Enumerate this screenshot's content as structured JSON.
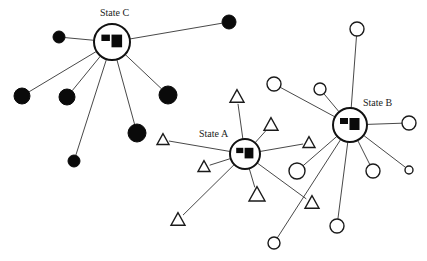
{
  "diagram": {
    "title": "",
    "colors": {
      "ink": "#0a0a0a",
      "edge": "#333333",
      "background": "#ffffff"
    },
    "hubs": [
      {
        "id": "C",
        "label": "State C",
        "cx": 112,
        "cy": 42,
        "r": 18,
        "label_x": 100,
        "label_y": 16,
        "satellite_shape": "filled-circle",
        "satellites": [
          {
            "x": 59,
            "y": 37,
            "r": 6
          },
          {
            "x": 22,
            "y": 96,
            "r": 8
          },
          {
            "x": 67,
            "y": 97,
            "r": 8
          },
          {
            "x": 74,
            "y": 161,
            "r": 6
          },
          {
            "x": 137,
            "y": 133,
            "r": 9
          },
          {
            "x": 168,
            "y": 95,
            "r": 9
          },
          {
            "x": 229,
            "y": 22,
            "r": 7
          }
        ]
      },
      {
        "id": "A",
        "label": "State A",
        "cx": 245,
        "cy": 154,
        "r": 15,
        "label_x": 199,
        "label_y": 137,
        "satellite_shape": "open-triangle",
        "satellites": [
          {
            "x": 163,
            "y": 140,
            "s": 6
          },
          {
            "x": 204,
            "y": 167,
            "s": 6
          },
          {
            "x": 178,
            "y": 220,
            "s": 7
          },
          {
            "x": 237,
            "y": 97,
            "s": 7
          },
          {
            "x": 271,
            "y": 125,
            "s": 7
          },
          {
            "x": 309,
            "y": 143,
            "s": 6
          },
          {
            "x": 257,
            "y": 195,
            "s": 8
          },
          {
            "x": 312,
            "y": 203,
            "s": 7
          }
        ]
      },
      {
        "id": "B",
        "label": "State B",
        "cx": 350,
        "cy": 125,
        "r": 17,
        "label_x": 363,
        "label_y": 106,
        "satellite_shape": "open-circle",
        "satellites": [
          {
            "x": 357,
            "y": 29,
            "r": 7
          },
          {
            "x": 274,
            "y": 84,
            "r": 7
          },
          {
            "x": 320,
            "y": 89,
            "r": 6
          },
          {
            "x": 409,
            "y": 123,
            "r": 7
          },
          {
            "x": 297,
            "y": 171,
            "r": 8
          },
          {
            "x": 373,
            "y": 171,
            "r": 7
          },
          {
            "x": 409,
            "y": 170,
            "r": 4
          },
          {
            "x": 337,
            "y": 226,
            "r": 7
          },
          {
            "x": 274,
            "y": 243,
            "r": 6
          }
        ]
      }
    ]
  }
}
